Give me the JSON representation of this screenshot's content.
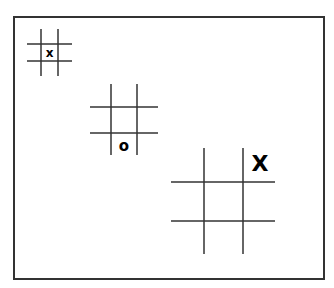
{
  "boards": [
    {
      "id": "small",
      "mark": "x",
      "mark_cell": "center"
    },
    {
      "id": "medium",
      "mark": "o",
      "mark_cell": "bottom-center"
    },
    {
      "id": "large",
      "mark": "X",
      "mark_cell": "top-right"
    }
  ],
  "colors": {
    "line": "#333333",
    "mark": "#000000",
    "background": "#ffffff"
  }
}
